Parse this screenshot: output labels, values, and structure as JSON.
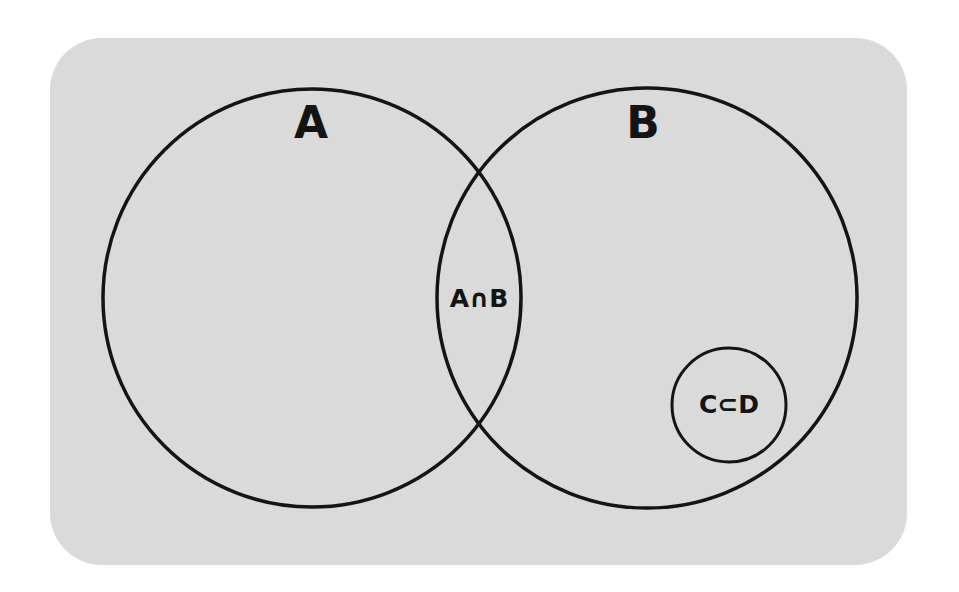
{
  "diagram": {
    "type": "venn",
    "background_color": "#dadada",
    "stroke_color": "#141414",
    "sets": [
      {
        "id": "A",
        "label": "A",
        "cx": 312,
        "cy": 298,
        "r": 209
      },
      {
        "id": "B",
        "label": "B",
        "cx": 647,
        "cy": 298,
        "r": 210
      },
      {
        "id": "C",
        "label": "C⊂D",
        "cx": 729,
        "cy": 405,
        "r": 57
      }
    ],
    "labels": {
      "set_a": "A",
      "set_b": "B",
      "intersection": "A∩B",
      "subset": "C⊂D"
    }
  }
}
